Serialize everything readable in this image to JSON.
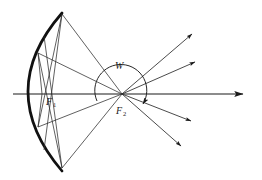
{
  "figure": {
    "kind": "optics-ray-diagram",
    "background_color": "#ffffff",
    "stroke_color": "#1a1a1a",
    "mirror_color": "#111111",
    "width": 262,
    "height": 180
  },
  "labels": {
    "focus_one": {
      "text": "F",
      "sub": "1",
      "x": 46,
      "y": 104
    },
    "focus_two": {
      "text": "F",
      "sub": "2",
      "x": 117,
      "y": 113
    },
    "angle": {
      "text": "W",
      "x": 118,
      "y": 68
    }
  },
  "geometry": {
    "axis": {
      "x1": 13,
      "y1": 94,
      "x2": 246,
      "y2": 94
    },
    "focus_one_point": {
      "x": 42,
      "y": 94
    },
    "focus_two_point": {
      "x": 122,
      "y": 94
    },
    "mirror": {
      "start_x": 62,
      "start_y": 13,
      "ctrl_x": -6,
      "ctrl_y": 91,
      "end_x": 62,
      "end_y": 171,
      "stroke_width": 2.6
    },
    "angle_arc": {
      "center_x": 122,
      "center_y": 94,
      "radius": 26,
      "start_angle_deg": 196,
      "end_angle_deg": 330
    },
    "mirror_contacts": [
      {
        "x": 62,
        "y": 13
      },
      {
        "x": 38,
        "y": 53
      },
      {
        "x": 38,
        "y": 127
      },
      {
        "x": 62,
        "y": 168
      }
    ],
    "outgoing_rays": [
      {
        "x2": 197,
        "y2": 31
      },
      {
        "x2": 200,
        "y2": 60
      },
      {
        "x2": 196,
        "y2": 123
      },
      {
        "x2": 186,
        "y2": 148
      }
    ]
  }
}
